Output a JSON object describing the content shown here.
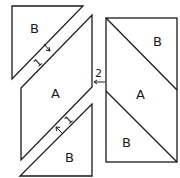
{
  "diagram": {
    "left_unit": {
      "top_triangle": {
        "label": "B"
      },
      "parallelogram": {
        "label": "A"
      },
      "bottom_triangle": {
        "label": "B"
      },
      "step_top": {
        "label": "1"
      },
      "step_bottom": {
        "label": "1"
      }
    },
    "right_unit": {
      "top_triangle": {
        "label": "B"
      },
      "middle_parallelogram": {
        "label": "A"
      },
      "bottom_triangle": {
        "label": "B"
      }
    },
    "join_step": {
      "label": "2"
    },
    "colors": {
      "stroke": "#1a1a1a",
      "background": "#ffffff"
    }
  }
}
